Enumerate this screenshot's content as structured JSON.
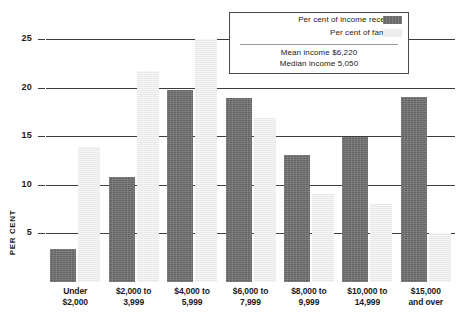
{
  "chart_data": {
    "type": "bar",
    "title": "",
    "xlabel": "",
    "ylabel": "PER CENT",
    "ylim": [
      0,
      27
    ],
    "grid": true,
    "yticks": [
      "5",
      "10",
      "15",
      "20",
      "25"
    ],
    "ytick_values": [
      5,
      10,
      15,
      20,
      25
    ],
    "categories": [
      "Under\n$2,000",
      "$2,000 to\n3,999",
      "$4,000 to\n5,999",
      "$6,000 to\n7,999",
      "$8,000 to\n9,999",
      "$10,000 to\n14,999",
      "$15,000\nand over"
    ],
    "category_lines": [
      [
        "Under",
        "$2,000"
      ],
      [
        "$2,000 to",
        "3,999"
      ],
      [
        "$4,000 to",
        "5,999"
      ],
      [
        "$6,000 to",
        "7,999"
      ],
      [
        "$8,000 to",
        "9,999"
      ],
      [
        "$10,000 to",
        "14,999"
      ],
      [
        "$15,000",
        "and over"
      ]
    ],
    "series": [
      {
        "name": "Per cent of income received",
        "color": "#6f6f6f",
        "values": [
          3.4,
          10.8,
          19.8,
          19.0,
          13.1,
          14.9,
          19.1
        ]
      },
      {
        "name": "Per cent of families",
        "color": "#ededed",
        "values": [
          13.9,
          21.7,
          25.0,
          16.9,
          9.1,
          8.0,
          5.1
        ]
      }
    ],
    "legend_position": "top-right",
    "annotations": [
      "Mean income $6,220",
      "Median income 5,050"
    ]
  },
  "legend": {
    "entries": [
      {
        "label": "Per cent of income received",
        "swatch": "dark"
      },
      {
        "label": "Per cent of families",
        "swatch": "light"
      }
    ],
    "notes": [
      "Mean income $6,220",
      "Median income 5,050"
    ]
  }
}
